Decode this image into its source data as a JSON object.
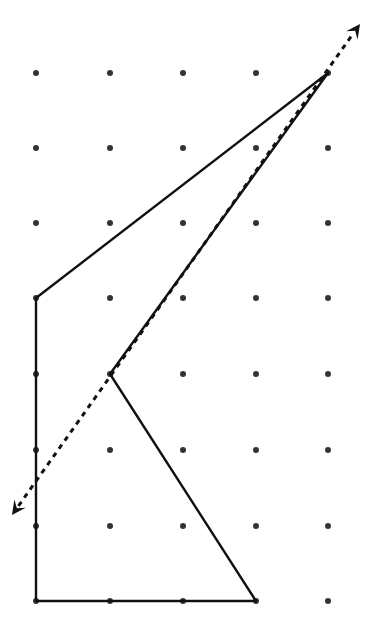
{
  "diagram": {
    "type": "dot-grid-symmetry",
    "background_color": "#ffffff",
    "dot_color": "#333333",
    "line_color": "#111111",
    "grid": {
      "columns_x": [
        36,
        110,
        183,
        256,
        328
      ],
      "rows_y": [
        73,
        148,
        223,
        298,
        374,
        450,
        526,
        601
      ],
      "dot_radius": 3
    },
    "polygon": {
      "label": "shape",
      "points": [
        [
          328,
          73
        ],
        [
          36,
          298
        ],
        [
          36,
          601
        ],
        [
          256,
          601
        ],
        [
          110,
          374
        ]
      ],
      "stroke_width": 2.4
    },
    "line_of_symmetry": {
      "label": "dashed-line-with-arrows",
      "from": [
        12,
        515
      ],
      "to": [
        360,
        24
      ],
      "dash": "5,5",
      "stroke_width": 3
    }
  }
}
